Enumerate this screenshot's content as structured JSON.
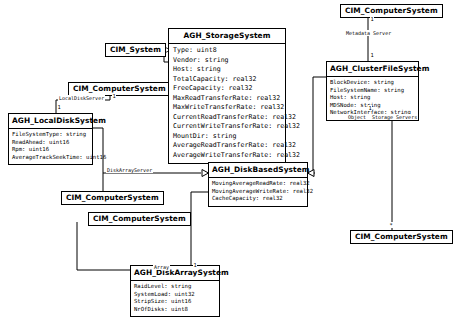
{
  "diagram": {
    "type": "uml-class-diagram",
    "background_color": "#ffffff",
    "line_color": "#000000"
  },
  "classes": [
    {
      "id": "cim_system",
      "name": "CIM_System",
      "kind": "plain",
      "attributes": []
    },
    {
      "id": "cim_computersystem_localdisk",
      "name": "CIM_ComputerSystem",
      "kind": "plain",
      "attributes": []
    },
    {
      "id": "cim_computersystem_metadata",
      "name": "CIM_ComputerSystem",
      "kind": "plain",
      "attributes": []
    },
    {
      "id": "cim_computersystem_diskarrayserver",
      "name": "CIM_ComputerSystem",
      "kind": "plain",
      "attributes": []
    },
    {
      "id": "cim_computersystem_array",
      "name": "CIM_ComputerSystem",
      "kind": "plain",
      "attributes": []
    },
    {
      "id": "cim_computersystem_oss",
      "name": "CIM_ComputerSystem",
      "kind": "plain",
      "attributes": []
    },
    {
      "id": "agh_storagesystem",
      "name": "AGH_StorageSystem",
      "kind": "class",
      "attributes": [
        "Type: uint8",
        "Vendor: string",
        "Host: string",
        "TotalCapacity: real32",
        "FreeCapacity: real32",
        "MaxReadTransferRate: real32",
        "MaxWriteTransferRate: real32",
        "CurrentReadTransferRate: real32",
        "CurrentWriteTransferRate: real32",
        "MountDir: string",
        "AverageReadTransferRate: real32",
        "AverageWriteTransferRate: real32"
      ]
    },
    {
      "id": "agh_clusterfilesystem",
      "name": "AGH_ClusterFileSystem",
      "kind": "class",
      "attributes": [
        "BlockDevice: string",
        "FileSystemName: string",
        "Host: string",
        "MDSNode: string",
        "NetworkInterface: string"
      ]
    },
    {
      "id": "agh_localdisksystem",
      "name": "AGH_LocalDiskSystem",
      "kind": "class",
      "attributes": [
        "FileSystemType: string",
        "ReadAhead: uint16",
        "Rpm: uint16",
        "AverageTrackSeekTime: uint16"
      ]
    },
    {
      "id": "agh_diskbasedsystem",
      "name": "AGH_DiskBasedSystem",
      "kind": "class",
      "attributes": [
        "MovingAverageReadRate: real32",
        "MovingAverageWriteRate: real32",
        "CacheCapacity: real32"
      ]
    },
    {
      "id": "agh_diskarraysystem",
      "name": "AGH_DiskArraySystem",
      "kind": "class",
      "attributes": [
        "RaidLevel: string",
        "SystemLoad: uint32",
        "StripSize: uint16",
        "NrOfDisks: uint8"
      ]
    }
  ],
  "associations": [
    {
      "id": "assoc_localdiskserver",
      "label": "LocalDiskServer",
      "source_multiplicity": "1",
      "target_multiplicity": "1"
    },
    {
      "id": "assoc_metadataserver",
      "label": "Metadata Server",
      "source_multiplicity": "1",
      "target_multiplicity": "1"
    },
    {
      "id": "assoc_objectstorageservers",
      "label_prefix": "Object",
      "label": "Storage Servers",
      "source_multiplicity": "1",
      "target_multiplicity": "*"
    },
    {
      "id": "assoc_diskarrayserver",
      "label": "DiskArrayServer",
      "source_multiplicity": "",
      "target_multiplicity": ""
    },
    {
      "id": "assoc_array",
      "label": "Array",
      "source_multiplicity": "",
      "target_multiplicity": "1"
    }
  ],
  "generalizations": [
    {
      "id": "gen_storage_to_cimsystem",
      "from": "agh_storagesystem",
      "to": "cim_system"
    },
    {
      "id": "gen_diskbased_to_storage",
      "from": "agh_diskbasedsystem",
      "to": "agh_storagesystem"
    },
    {
      "id": "gen_localdisk_to_diskbased",
      "from": "agh_localdisksystem",
      "to": "agh_diskbasedsystem"
    },
    {
      "id": "gen_diskarray_to_diskbased",
      "from": "agh_diskarraysystem",
      "to": "agh_diskbasedsystem"
    },
    {
      "id": "gen_clusterfs_to_diskbased",
      "from": "agh_clusterfilesystem",
      "to": "agh_diskbasedsystem"
    }
  ]
}
